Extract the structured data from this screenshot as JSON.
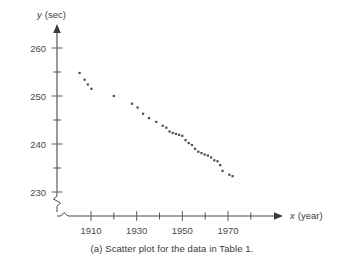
{
  "caption": "(a) Scatter plot for the data in Table 1.",
  "axis_titles": {
    "y_var": "y",
    "y_unit": "(sec)",
    "x_var": "x",
    "x_unit": "(year)"
  },
  "colors": {
    "point": "#4b4b4b",
    "axis": "#4a4a4a",
    "text": "#3a3a3a",
    "background": "#ffffff"
  },
  "chart_data": {
    "type": "scatter",
    "title": "",
    "subtitle": "",
    "xlabel": "x (year)",
    "ylabel": "y (sec)",
    "xlim": [
      1900,
      1984
    ],
    "ylim": [
      226,
      262
    ],
    "grid": false,
    "legend": "none",
    "x_ticks_major": [
      1910,
      1930,
      1950,
      1970
    ],
    "x_tick_labels": [
      "1910",
      "1930",
      "1950",
      "1970"
    ],
    "x_ticks_minor": [
      1920,
      1940,
      1960,
      1980
    ],
    "y_ticks_major": [
      230,
      240,
      250,
      260
    ],
    "y_tick_labels": [
      "230",
      "240",
      "250",
      "260"
    ],
    "y_ticks_minor": [
      235,
      245,
      255
    ],
    "axis_break_x": true,
    "axis_break_y": true,
    "marker": "square",
    "marker_size": 2.2,
    "annotations": [],
    "points": [
      {
        "x": 1906,
        "y": 252.0
      },
      {
        "x": 1908,
        "y": 250.4
      },
      {
        "x": 1912,
        "y": 248.2
      },
      {
        "x": 1920,
        "y": 241.8
      },
      {
        "x": 1924,
        "y": 233.6
      },
      {
        "x": 1928,
        "y": 233.2
      },
      {
        "x": 1932,
        "y": 231.2
      },
      {
        "x": 1936,
        "y": 227.8
      },
      {
        "x": 1948,
        "y": 229.8
      },
      {
        "x": 1952,
        "y": 225.2
      },
      {
        "x": 1956,
        "y": 221.2
      },
      {
        "x": 1960,
        "y": 215.6
      },
      {
        "x": 1964,
        "y": 218.1
      },
      {
        "x": 1968,
        "y": 214.9
      },
      {
        "x": 1972,
        "y": 216.3
      },
      {
        "x": 1976,
        "y": 219.2
      },
      {
        "x": 1980,
        "y": 218.4
      }
    ],
    "plotted_points": [
      {
        "x": 1905.0,
        "y": 254.8
      },
      {
        "x": 1907.2,
        "y": 253.4
      },
      {
        "x": 1908.6,
        "y": 252.4
      },
      {
        "x": 1910.2,
        "y": 251.5
      },
      {
        "x": 1920.0,
        "y": 250.0
      },
      {
        "x": 1928.0,
        "y": 248.4
      },
      {
        "x": 1930.4,
        "y": 247.6
      },
      {
        "x": 1932.8,
        "y": 246.3
      },
      {
        "x": 1935.4,
        "y": 245.4
      },
      {
        "x": 1938.6,
        "y": 244.6
      },
      {
        "x": 1941.4,
        "y": 243.8
      },
      {
        "x": 1943.0,
        "y": 243.4
      },
      {
        "x": 1944.4,
        "y": 242.6
      },
      {
        "x": 1945.8,
        "y": 242.3
      },
      {
        "x": 1947.2,
        "y": 242.1
      },
      {
        "x": 1948.6,
        "y": 241.9
      },
      {
        "x": 1950.0,
        "y": 241.7
      },
      {
        "x": 1951.4,
        "y": 240.8
      },
      {
        "x": 1952.8,
        "y": 240.2
      },
      {
        "x": 1954.2,
        "y": 239.8
      },
      {
        "x": 1955.6,
        "y": 239.0
      },
      {
        "x": 1957.0,
        "y": 238.4
      },
      {
        "x": 1958.4,
        "y": 238.1
      },
      {
        "x": 1959.8,
        "y": 237.8
      },
      {
        "x": 1961.2,
        "y": 237.6
      },
      {
        "x": 1962.6,
        "y": 237.2
      },
      {
        "x": 1964.0,
        "y": 236.6
      },
      {
        "x": 1965.4,
        "y": 236.4
      },
      {
        "x": 1966.6,
        "y": 235.6
      },
      {
        "x": 1967.6,
        "y": 234.4
      },
      {
        "x": 1970.6,
        "y": 233.6
      },
      {
        "x": 1972.0,
        "y": 233.3
      }
    ]
  }
}
